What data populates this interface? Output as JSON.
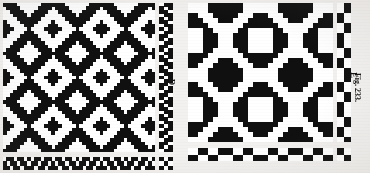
{
  "figure": {
    "caption": "Fig. 233.",
    "background_color": "#f3f1ef",
    "ink_color": "#101010",
    "paper_color": "#ffffff"
  },
  "drafts": [
    {
      "id": "draft-d",
      "label": "D",
      "type": "weaving-draft",
      "description": "Point twill / diamond twill weave drawdown with diagonal chevron motif",
      "x": 3,
      "y": 3,
      "width": 152,
      "height": 149,
      "cols": 44,
      "rows": 43,
      "cell": 3.45,
      "pattern": "diamond-twill",
      "repeat_x": 22,
      "repeat_y": 22,
      "shift": 1,
      "threading_bar": {
        "x": 3,
        "y": 157,
        "width": 152,
        "height": 13,
        "cols": 44,
        "rows": 3
      },
      "treadling_bar": {
        "x": 159,
        "y": 3,
        "width": 14,
        "height": 149,
        "cols": 3,
        "rows": 43
      },
      "tieup": {
        "x": 159,
        "y": 157,
        "width": 14,
        "height": 13,
        "cols": 3,
        "rows": 3
      }
    },
    {
      "id": "draft-e",
      "label": "E",
      "type": "weaving-draft",
      "description": "Broken/undulating twill drawdown with scattered float clusters",
      "x": 188,
      "y": 3,
      "width": 145,
      "height": 139,
      "cols": 29,
      "rows": 28,
      "cell": 5.0,
      "pattern": "undulating-twill",
      "repeat_x": 14,
      "repeat_y": 14,
      "shift": 2,
      "threading_bar": {
        "x": 188,
        "y": 148,
        "width": 145,
        "height": 13,
        "cols": 29,
        "rows": 2
      },
      "treadling_bar": {
        "x": 337,
        "y": 3,
        "width": 14,
        "height": 139,
        "cols": 2,
        "rows": 28
      },
      "tieup": {
        "x": 337,
        "y": 148,
        "width": 14,
        "height": 13,
        "cols": 2,
        "rows": 2
      }
    }
  ],
  "labels": {
    "draft_d_label": "D",
    "draft_e_label": "E",
    "figure_caption": "Fig. 233."
  }
}
